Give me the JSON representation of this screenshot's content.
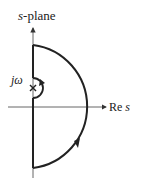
{
  "diagram": {
    "title_italic": "s",
    "title_rest": "-plane",
    "imag_label": "jω",
    "real_label_prefix": "Re ",
    "real_label_italic": "s",
    "colors": {
      "stroke": "#222222",
      "axis": "#444444"
    }
  }
}
